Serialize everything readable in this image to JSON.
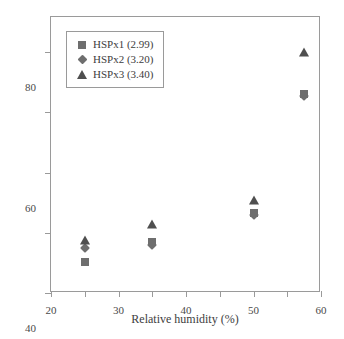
{
  "chart_data": {
    "type": "scatter",
    "title": "",
    "xlabel": "Relative humidity (%)",
    "ylabel": "Water uptake (wt%)",
    "xlim": [
      20,
      100
    ],
    "ylim": [
      0,
      91.7
    ],
    "xticks": [
      20,
      30,
      40,
      50,
      60,
      70,
      80,
      90,
      100
    ],
    "yticks": [
      0,
      20,
      40,
      60,
      80
    ],
    "grid": false,
    "legend_position": "upper-left-inside",
    "x": [
      30,
      50,
      80,
      95
    ],
    "series": [
      {
        "name": "HSPx1 (2.99)",
        "marker": "square",
        "color": "#6e6e6e",
        "values": [
          10.2,
          16.8,
          26.5,
          66.0
        ]
      },
      {
        "name": "HSPx2 (3.20)",
        "marker": "diamond",
        "color": "#6e6e6e",
        "values": [
          14.9,
          16.0,
          26.0,
          65.3
        ]
      },
      {
        "name": "HSPx3 (3.40)",
        "marker": "triangle",
        "color": "#4f4f4f",
        "values": [
          17.6,
          23.0,
          31.0,
          80.0
        ]
      }
    ]
  },
  "legend": {
    "items": [
      {
        "label": "HSPx1 (2.99)",
        "marker": "square"
      },
      {
        "label": "HSPx2 (3.20)",
        "marker": "diamond"
      },
      {
        "label": "HSPx3 (3.40)",
        "marker": "triangle"
      }
    ]
  },
  "axes": {
    "x_title": "Relative humidity (%)",
    "y_title": "Water uptake (wt%)",
    "x_tick_labels": [
      "20",
      "30",
      "40",
      "50",
      "60",
      "70",
      "80",
      "90",
      "100"
    ],
    "y_tick_labels": [
      "0",
      "20",
      "40",
      "60",
      "80"
    ]
  },
  "colors": {
    "marker_light": "#6e6e6e",
    "marker_dark": "#4f4f4f",
    "frame": "#9a9a9a",
    "text": "#3d3d3d",
    "background": "#ffffff"
  }
}
